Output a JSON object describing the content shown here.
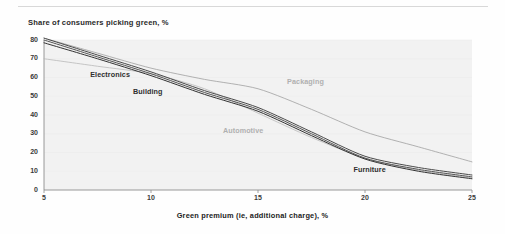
{
  "figure": {
    "title": "Share of consumers picking green, %",
    "xlabel": "Green premium (ie, additional charge), %",
    "background": "#fefefe",
    "plot_background": "#f2f2f2"
  },
  "chart_data": {
    "type": "line",
    "title": "Share of consumers picking green, %",
    "xlabel": "Green premium (ie, additional charge), %",
    "ylabel": "",
    "xlim": [
      5,
      25
    ],
    "ylim": [
      0,
      80
    ],
    "xticks": [
      5,
      10,
      15,
      20,
      25
    ],
    "yticks": [
      0,
      10,
      20,
      30,
      40,
      50,
      60,
      70,
      80
    ],
    "grid": false,
    "legend": "inline-labels",
    "x": [
      5,
      7.5,
      10,
      12.5,
      15,
      17.5,
      20,
      22.5,
      25
    ],
    "series": [
      {
        "name": "Electronics",
        "color": "#4a4a4a",
        "values": [
          81,
          72,
          63,
          53,
          44,
          31,
          18,
          12,
          8
        ],
        "label_x": 8.0,
        "label_y": 62
      },
      {
        "name": "Building",
        "color": "#555555",
        "values": [
          80,
          71,
          62,
          52,
          43,
          30,
          17,
          11,
          7
        ],
        "label_x": 10.0,
        "label_y": 53
      },
      {
        "name": "Furniture",
        "color": "#333333",
        "values": [
          78.5,
          70,
          61,
          51,
          42,
          29,
          16.5,
          10,
          6
        ],
        "label_x": 20.3,
        "label_y": 11
      },
      {
        "name": "Automotive",
        "color": "#b9b9b9",
        "values": [
          70,
          66,
          62,
          54,
          41,
          28,
          17,
          10.5,
          6.5
        ],
        "label_x": 14.2,
        "label_y": 32
      },
      {
        "name": "Packaging",
        "color": "#a0a0a0",
        "values": [
          81,
          73,
          65,
          59,
          54,
          43,
          31,
          23,
          15
        ],
        "label_x": 17.2,
        "label_y": 58
      }
    ]
  },
  "axes": {
    "yticks": [
      "0",
      "10",
      "20",
      "30",
      "40",
      "50",
      "60",
      "70",
      "80"
    ],
    "xticks": [
      "5",
      "10",
      "15",
      "20",
      "25"
    ]
  }
}
